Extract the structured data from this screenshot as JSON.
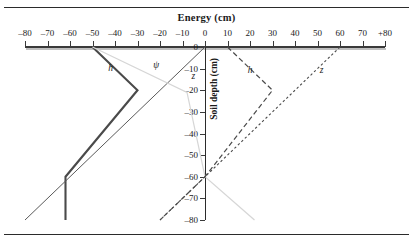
{
  "figure": {
    "top_rule": true,
    "bottom_rule": true,
    "background": "#ffffff"
  },
  "chart_data": {
    "type": "line",
    "title": "Energy (cm)",
    "xlabel": "Energy (cm)",
    "ylabel": "Soil depth (cm)",
    "xlim": [
      -80,
      80
    ],
    "ylim": [
      -80,
      0
    ],
    "grid": false,
    "legend": "inline-annotations",
    "x_ticks": [
      -80,
      -70,
      -60,
      -50,
      -40,
      -30,
      -20,
      -10,
      0,
      10,
      20,
      30,
      40,
      50,
      60,
      70,
      80
    ],
    "x_tick_labels": [
      "–80",
      "–70",
      "–60",
      "–50",
      "–40",
      "–30",
      "–20",
      "–10",
      "0",
      "10",
      "20",
      "30",
      "40",
      "50",
      "60",
      "70",
      "+80"
    ],
    "y_ticks": [
      0,
      -10,
      -20,
      -30,
      -40,
      -50,
      -60,
      -70,
      -80
    ],
    "y_tick_labels": [
      "0",
      "–10",
      "–20",
      "–30",
      "–40",
      "–50",
      "–60",
      "–70",
      "–80"
    ],
    "series": [
      {
        "name": "h-left",
        "label": "h",
        "style": "solid-thick",
        "color": "#4a4a4a",
        "width": 2.1,
        "points": [
          [
            -50,
            0
          ],
          [
            -30,
            -20
          ],
          [
            -62,
            -60
          ],
          [
            -62,
            -80
          ]
        ]
      },
      {
        "name": "z-left",
        "label": "z",
        "style": "solid-thin",
        "color": "#5a5a5a",
        "width": 1.0,
        "points": [
          [
            0,
            0
          ],
          [
            -80,
            -80
          ]
        ]
      },
      {
        "name": "psi-left",
        "label": "ψ",
        "style": "solid-light",
        "color": "#d6d6d6",
        "width": 1.2,
        "points": [
          [
            -50,
            0
          ],
          [
            -8,
            -21
          ],
          [
            0,
            -60
          ],
          [
            22,
            -80
          ]
        ]
      },
      {
        "name": "h-right",
        "label": "h",
        "style": "dashed",
        "color": "#4a4a4a",
        "width": 1.2,
        "points": [
          [
            10,
            0
          ],
          [
            30,
            -20
          ],
          [
            0,
            -60
          ],
          [
            -20,
            -80
          ]
        ]
      },
      {
        "name": "z-right",
        "label": "z",
        "style": "dotted",
        "color": "#4a4a4a",
        "width": 1.1,
        "points": [
          [
            60,
            0
          ],
          [
            0,
            -60
          ],
          [
            -20,
            -80
          ]
        ]
      }
    ],
    "annotations": [
      {
        "name": "label-h-left",
        "text": "h",
        "x": -43,
        "y": -10
      },
      {
        "name": "label-psi-left",
        "text": "ψ",
        "x": -23,
        "y": -9
      },
      {
        "name": "label-z-left",
        "text": "z",
        "x": -6,
        "y": -14
      },
      {
        "name": "label-h-right",
        "text": "h",
        "x": 19,
        "y": -11
      },
      {
        "name": "label-z-right",
        "text": "z",
        "x": 51,
        "y": -11
      }
    ]
  }
}
